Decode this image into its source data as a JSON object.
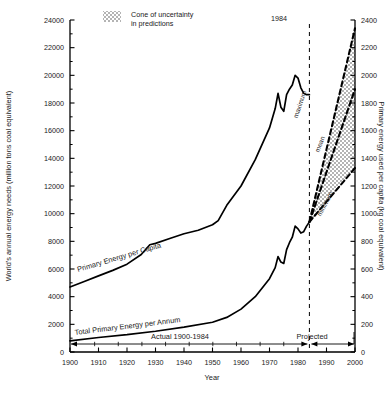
{
  "chart_data": {
    "type": "line",
    "title": "",
    "xlabel": "Year",
    "ylabel_left": "World's annual energy needs  (million tons coal equivalent)",
    "ylabel_right": "Primary energy used per capita (kg coal equivalent)",
    "xlim": [
      1900,
      2000
    ],
    "ylim_left": [
      0,
      24000
    ],
    "ylim_right": [
      0,
      2400
    ],
    "grid": false,
    "x_ticks": [
      1900,
      1910,
      1920,
      1930,
      1940,
      1950,
      1960,
      1970,
      1980,
      1990,
      2000
    ],
    "x_tick_labels": [
      "1900",
      "1910",
      "1920",
      "1930",
      "1940",
      "1950",
      "1960",
      "1970",
      "1980",
      "1990",
      "2000"
    ],
    "y_ticks_left": [
      0,
      2000,
      4000,
      6000,
      8000,
      10000,
      12000,
      14000,
      16000,
      18000,
      20000,
      22000,
      24000
    ],
    "y_tick_labels_left": [
      "0",
      "2000",
      "4000",
      "6000",
      "8000",
      "10000",
      "12000",
      "14000",
      "16000",
      "18000",
      "20000",
      "22000",
      "24000"
    ],
    "y_minor_ticks_left": [
      1000,
      3000,
      5000,
      7000,
      9000,
      11000,
      13000,
      15000,
      17000,
      19000,
      21000,
      23000
    ],
    "y_ticks_right": [
      0,
      200,
      400,
      600,
      800,
      1000,
      1200,
      1400,
      1600,
      1800,
      2000,
      2200,
      2400
    ],
    "y_tick_labels_right": [
      "0",
      "200",
      "400",
      "600",
      "800",
      "1000",
      "1200",
      "1400",
      "1600",
      "1800",
      "2000",
      "2200",
      "2400"
    ],
    "legend_position": "top-center",
    "legend": [
      {
        "label_line1": "Cone of uncertainty",
        "label_line2": "in predictions",
        "swatch": "stipple-gray"
      }
    ],
    "annotations": [
      {
        "name": "divider-year",
        "text": "1984",
        "x": 1984
      },
      {
        "name": "actual-span",
        "text": "Actual 1900-1984"
      },
      {
        "name": "projected-span",
        "text": "Projected"
      }
    ],
    "series": [
      {
        "name": "Primary Energy per Capita",
        "label": "Primary Energy  per Capita",
        "axis": "left",
        "style": "solid",
        "points": [
          [
            1900,
            4700
          ],
          [
            1905,
            5100
          ],
          [
            1910,
            5500
          ],
          [
            1915,
            5900
          ],
          [
            1920,
            6350
          ],
          [
            1925,
            7050
          ],
          [
            1928,
            7750
          ],
          [
            1930,
            7850
          ],
          [
            1935,
            8200
          ],
          [
            1940,
            8550
          ],
          [
            1945,
            8800
          ],
          [
            1950,
            9200
          ],
          [
            1952,
            9500
          ],
          [
            1955,
            10600
          ],
          [
            1960,
            12000
          ],
          [
            1965,
            13900
          ],
          [
            1970,
            16200
          ],
          [
            1972,
            17600
          ],
          [
            1973,
            18700
          ],
          [
            1974,
            17700
          ],
          [
            1975,
            17400
          ],
          [
            1976,
            18600
          ],
          [
            1977,
            19000
          ],
          [
            1978,
            19300
          ],
          [
            1979,
            20000
          ],
          [
            1980,
            19800
          ],
          [
            1981,
            19100
          ],
          [
            1982,
            18700
          ],
          [
            1983,
            18600
          ],
          [
            1984,
            18600
          ]
        ]
      },
      {
        "name": "Total Primary Energy per Annum",
        "label": "Total Primary Energy per Annum",
        "axis": "left",
        "style": "solid",
        "points": [
          [
            1900,
            800
          ],
          [
            1910,
            1050
          ],
          [
            1920,
            1250
          ],
          [
            1930,
            1500
          ],
          [
            1940,
            1800
          ],
          [
            1950,
            2150
          ],
          [
            1955,
            2500
          ],
          [
            1960,
            3100
          ],
          [
            1965,
            4000
          ],
          [
            1970,
            5300
          ],
          [
            1972,
            6100
          ],
          [
            1973,
            6900
          ],
          [
            1974,
            6500
          ],
          [
            1975,
            6400
          ],
          [
            1976,
            7400
          ],
          [
            1977,
            7900
          ],
          [
            1978,
            8300
          ],
          [
            1979,
            9100
          ],
          [
            1980,
            8900
          ],
          [
            1981,
            8600
          ],
          [
            1982,
            8700
          ],
          [
            1983,
            9100
          ],
          [
            1984,
            9400
          ]
        ]
      },
      {
        "name": "maximum",
        "label": "maximum",
        "axis": "left",
        "style": "dashed",
        "points": [
          [
            1984,
            9400
          ],
          [
            2000,
            23400
          ]
        ]
      },
      {
        "name": "mean",
        "label": "mean",
        "axis": "left",
        "style": "dashed",
        "points": [
          [
            1984,
            9400
          ],
          [
            2000,
            19000
          ]
        ]
      },
      {
        "name": "minimum",
        "label": "minimum",
        "axis": "left",
        "style": "dashed",
        "points": [
          [
            1984,
            9400
          ],
          [
            2000,
            13300
          ]
        ]
      }
    ],
    "shaded_regions": [
      {
        "name": "cone-of-uncertainty",
        "fill": "stipple-gray",
        "polygon": [
          [
            1984,
            9400
          ],
          [
            2000,
            23400
          ],
          [
            2000,
            13300
          ]
        ]
      }
    ],
    "colors": {
      "axis": "#000000",
      "curve": "#000000",
      "cone_fill": "#bfbfbf",
      "background": "#ffffff"
    }
  }
}
